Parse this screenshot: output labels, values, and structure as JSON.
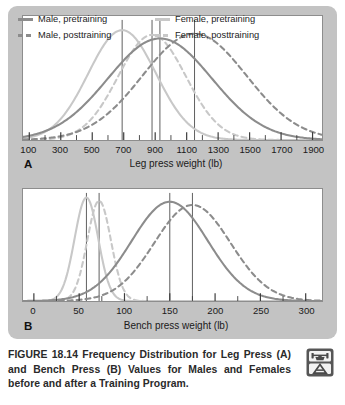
{
  "figure": {
    "caption_label": "FIGURE 18.14",
    "caption_body": "Frequency Distribution for Leg Press (A) and Bench Press (B) Values for Males and Females before and after a Training Program.",
    "caption_full": "FIGURE 18.14 Frequency Distribution for Leg Press (A) and Bench Press (B) Values for Males and Females before and after a Training Program.",
    "icon": "weightlifter-icon"
  },
  "colors": {
    "male": "#8c8c8c",
    "female": "#c8c8c8",
    "mean_line": "#5d5d5d",
    "card_background": "#c3c3c3",
    "plot_background": "#ffffff",
    "plot_border": "#8d8d8d",
    "text": "#1a1a1a"
  },
  "legend": {
    "items": [
      {
        "label": "Male, pretraining",
        "series": "male_pre",
        "style": "solid",
        "color": "#8c8c8c"
      },
      {
        "label": "Female, pretraining",
        "series": "female_pre",
        "style": "solid",
        "color": "#c8c8c8"
      },
      {
        "label": "Male, posttraining",
        "series": "male_post",
        "style": "dashed",
        "color": "#8c8c8c"
      },
      {
        "label": "Female, posttraining",
        "series": "female_post",
        "style": "dashed",
        "color": "#c8c8c8"
      }
    ]
  },
  "chart_data": [
    {
      "type": "line",
      "panel": "A",
      "panel_letter": "A",
      "title": "",
      "xlabel": "Leg press weight (lb)",
      "ylabel": "",
      "xlim": [
        60,
        1960
      ],
      "ylim": [
        0,
        1.05
      ],
      "grid": false,
      "legend_position": "top-inside",
      "xticks": [
        100,
        300,
        500,
        700,
        900,
        1100,
        1300,
        1500,
        1700,
        1900
      ],
      "xtick_labels": [
        "100",
        "300",
        "500",
        "700",
        "900",
        "1100",
        "1300",
        "1500",
        "1700",
        "1900"
      ],
      "minor_tick_step": 100,
      "series": [
        {
          "name": "Male, pretraining",
          "style": "solid",
          "color": "#8c8c8c",
          "mean": 930,
          "sd": 330,
          "peak": 0.86
        },
        {
          "name": "Male, posttraining",
          "style": "dashed",
          "color": "#8c8c8c",
          "mean": 1150,
          "sd": 330,
          "peak": 0.9
        },
        {
          "name": "Female, pretraining",
          "style": "solid",
          "color": "#c8c8c8",
          "mean": 690,
          "sd": 215,
          "peak": 0.93
        },
        {
          "name": "Female, posttraining",
          "style": "dashed",
          "color": "#c8c8c8",
          "mean": 880,
          "sd": 215,
          "peak": 0.89
        }
      ],
      "mean_lines": [
        690,
        880,
        930,
        1150
      ]
    },
    {
      "type": "line",
      "panel": "B",
      "panel_letter": "B",
      "title": "",
      "xlabel": "Bench press weight (lb)",
      "ylabel": "",
      "xlim": [
        -12,
        318
      ],
      "ylim": [
        0,
        1.05
      ],
      "grid": false,
      "legend_position": "none",
      "xticks": [
        0,
        50,
        100,
        150,
        200,
        250,
        300
      ],
      "xtick_labels": [
        "0",
        "50",
        "100",
        "150",
        "200",
        "250",
        "300"
      ],
      "minor_tick_step": 25,
      "series": [
        {
          "name": "Male, pretraining",
          "style": "solid",
          "color": "#8c8c8c",
          "mean": 150,
          "sd": 42,
          "peak": 0.93
        },
        {
          "name": "Male, posttraining",
          "style": "dashed",
          "color": "#8c8c8c",
          "mean": 175,
          "sd": 42,
          "peak": 0.9
        },
        {
          "name": "Female, pretraining",
          "style": "solid",
          "color": "#c8c8c8",
          "mean": 58,
          "sd": 13,
          "peak": 0.97
        },
        {
          "name": "Female, posttraining",
          "style": "dashed",
          "color": "#c8c8c8",
          "mean": 72,
          "sd": 13,
          "peak": 0.94
        }
      ],
      "mean_lines": [
        58,
        72,
        150,
        175
      ]
    }
  ]
}
